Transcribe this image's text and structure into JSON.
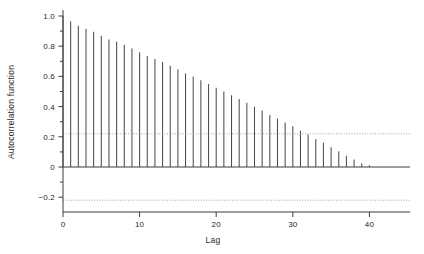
{
  "chart_data": {
    "type": "bar",
    "title": "",
    "subtitle": "",
    "xlabel": "Lag",
    "ylabel": "Autocorrelation function",
    "xlim": [
      -1.5,
      45
    ],
    "ylim": [
      -0.3,
      1.05
    ],
    "grid": false,
    "legend": null,
    "x_ticks": [
      0,
      10,
      20,
      30,
      40
    ],
    "x_tick_labels": [
      "0",
      "10",
      "20",
      "30",
      "40"
    ],
    "x_minor_ticks": [
      5,
      15,
      25,
      35
    ],
    "y_ticks": [
      1.0,
      0.8,
      0.6,
      0.4,
      0.2,
      0,
      -0.2
    ],
    "y_tick_labels": [
      "1.0",
      "0.8",
      "0.6",
      "0.4",
      "0.2",
      "0",
      "−0.2"
    ],
    "y_minor_ticks": [
      0.9,
      0.7,
      0.5,
      0.3,
      0.1,
      -0.1
    ],
    "annotations": [
      {
        "name": "upper-confidence-bound",
        "value": 0.22,
        "style": "dotted"
      },
      {
        "name": "lower-confidence-bound",
        "value": -0.22,
        "style": "dotted"
      },
      {
        "name": "zero-line",
        "value": 0,
        "style": "solid"
      }
    ],
    "confidence_level": 0.22,
    "bar_color": "#4d4d4d",
    "axis_color": "#3c3c3c",
    "confidence_line_color": "#9a9a9a",
    "x": [
      0,
      1,
      2,
      3,
      4,
      5,
      6,
      7,
      8,
      9,
      10,
      11,
      12,
      13,
      14,
      15,
      16,
      17,
      18,
      19,
      20,
      21,
      22,
      23,
      24,
      25,
      26,
      27,
      28,
      29,
      30,
      31,
      32,
      33,
      34,
      35,
      36,
      37,
      38,
      39,
      40,
      41,
      42,
      43,
      44
    ],
    "categories": [
      "0",
      "1",
      "2",
      "3",
      "4",
      "5",
      "6",
      "7",
      "8",
      "9",
      "10",
      "11",
      "12",
      "13",
      "14",
      "15",
      "16",
      "17",
      "18",
      "19",
      "20",
      "21",
      "22",
      "23",
      "24",
      "25",
      "26",
      "27",
      "28",
      "29",
      "30",
      "31",
      "32",
      "33",
      "34",
      "35",
      "36",
      "37",
      "38",
      "39",
      "40",
      "41",
      "42",
      "43",
      "44"
    ],
    "values": [
      1.0,
      0.965,
      0.935,
      0.915,
      0.895,
      0.87,
      0.845,
      0.83,
      0.81,
      0.785,
      0.76,
      0.735,
      0.715,
      0.695,
      0.67,
      0.645,
      0.62,
      0.6,
      0.575,
      0.55,
      0.525,
      0.5,
      0.475,
      0.45,
      0.425,
      0.4,
      0.375,
      0.345,
      0.32,
      0.295,
      0.27,
      0.24,
      0.215,
      0.185,
      0.16,
      0.13,
      0.105,
      0.075,
      0.05,
      0.025,
      0.012,
      0.0,
      0.0,
      0.0,
      0.0
    ]
  }
}
